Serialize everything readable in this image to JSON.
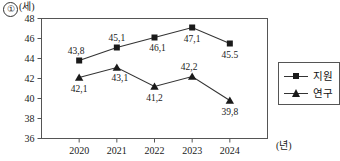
{
  "figure": {
    "item_number": "①",
    "y_unit_label": "(세)",
    "x_unit_label": "(년)"
  },
  "legend": {
    "items": [
      {
        "label": "지원",
        "marker": "square-marker-icon"
      },
      {
        "label": "연구",
        "marker": "triangle-marker-icon"
      }
    ]
  },
  "chart_data": {
    "type": "line",
    "title": "",
    "subtitle": "",
    "xlabel": "(년)",
    "ylabel": "(세)",
    "categories": [
      "2020",
      "2021",
      "2022",
      "2023",
      "2024"
    ],
    "xtick_labels": [
      "2020",
      "2021",
      "2022",
      "2023",
      "2024"
    ],
    "ytick_labels": [
      "36",
      "38",
      "40",
      "42",
      "44",
      "46",
      "48"
    ],
    "yticks": [
      36,
      38,
      40,
      42,
      44,
      46,
      48
    ],
    "ylim": [
      36,
      48
    ],
    "grid": false,
    "legend_position": "right-outside",
    "series": [
      {
        "name": "지원",
        "marker": "square",
        "values": [
          43.8,
          45.1,
          46.1,
          47.1,
          45.5
        ],
        "point_labels": [
          "43,8",
          "45,1",
          "46,1",
          "47,1",
          "45.5"
        ],
        "label_positions": [
          "above-left",
          "above",
          "below-right",
          "below",
          "below"
        ]
      },
      {
        "name": "연구",
        "marker": "triangle",
        "values": [
          42.1,
          43.1,
          41.2,
          42.2,
          39.8
        ],
        "point_labels": [
          "42,1",
          "43,1",
          "41,2",
          "42,2",
          "39,8"
        ],
        "label_positions": [
          "below",
          "below-right",
          "below",
          "above-left",
          "below"
        ]
      }
    ]
  }
}
